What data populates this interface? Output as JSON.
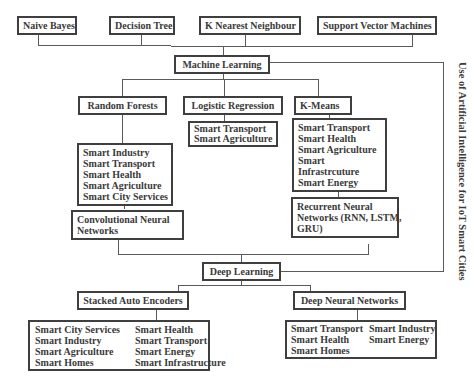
{
  "title": "Use of Artificial Intelligence for IoT Smart Cities",
  "top_algorithms": [
    "Naive Bayes",
    "Decision Tree",
    "K Nearest Neighbour",
    "Support Vector Machines"
  ],
  "machine_learning": {
    "label": "Machine Learning",
    "children": [
      {
        "label": "Random Forests",
        "applications": [
          "Smart Industry",
          "Smart Transport",
          "Smart Health",
          "Smart Agriculture",
          "Smart City Services"
        ]
      },
      {
        "label": "Logistic Regression",
        "applications": [
          "Smart Transport",
          "Smart Agriculture"
        ]
      },
      {
        "label": "K-Means",
        "applications": [
          "Smart Transport",
          "Smart Health",
          "Smart Agriculture",
          "Smart",
          "Infrastrcuture",
          "Smart Energy"
        ]
      }
    ]
  },
  "neural_inputs": [
    {
      "label_lines": [
        "Convolutional Neural",
        "Networks"
      ]
    },
    {
      "label_lines": [
        "Recurrent Neural",
        "Networks (RNN, LSTM,",
        "GRU)"
      ]
    }
  ],
  "deep_learning": {
    "label": "Deep Learning",
    "children": [
      {
        "label": "Stacked Auto Encoders",
        "applications_col1": [
          "Smart City Services",
          "Smart Industry",
          "Smart Agriculture",
          "Smart Homes"
        ],
        "applications_col2": [
          "Smart Health",
          "Smart Transport",
          "Smart Energy",
          "Smart Infrastructure"
        ]
      },
      {
        "label": "Deep Neural Networks",
        "applications_col1": [
          "Smart Transport",
          "Smart Health",
          "Smart Homes"
        ],
        "applications_col2": [
          "Smart Industry",
          "Smart Energy"
        ]
      }
    ]
  }
}
